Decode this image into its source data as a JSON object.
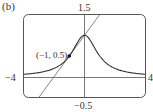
{
  "panel_label": "(b)",
  "chart_data": {
    "type": "line",
    "title": "",
    "xlabel": "",
    "ylabel": "",
    "xlim": [
      -4,
      4
    ],
    "ylim": [
      -0.5,
      1.5
    ],
    "grid": false,
    "legend": null,
    "tick_labels": {
      "y_top": "1.5",
      "y_bottom": "-0.5",
      "x_left": "-4",
      "x_right": "4"
    },
    "annotations": [
      {
        "text": "(-1, 0.5)",
        "x": -1,
        "y": 0.5,
        "marker": "point"
      }
    ],
    "series": [
      {
        "name": "curve",
        "description": "y = 1/(1+x^2)",
        "x": [
          -4,
          -3,
          -2,
          -1.5,
          -1,
          -0.5,
          0,
          0.5,
          1,
          1.5,
          2,
          3,
          4
        ],
        "y": [
          0.059,
          0.1,
          0.2,
          0.308,
          0.5,
          0.8,
          1.0,
          0.8,
          0.5,
          0.308,
          0.2,
          0.1,
          0.059
        ]
      },
      {
        "name": "tangent line",
        "description": "y = 0.5x + 1",
        "x": [
          -3,
          1
        ],
        "y": [
          -0.5,
          1.5
        ]
      }
    ]
  },
  "labels": {
    "y_top": "1.5",
    "y_bottom": "−0.5",
    "x_left": "−4",
    "x_right": "4",
    "point": "(−1, 0.5)"
  }
}
